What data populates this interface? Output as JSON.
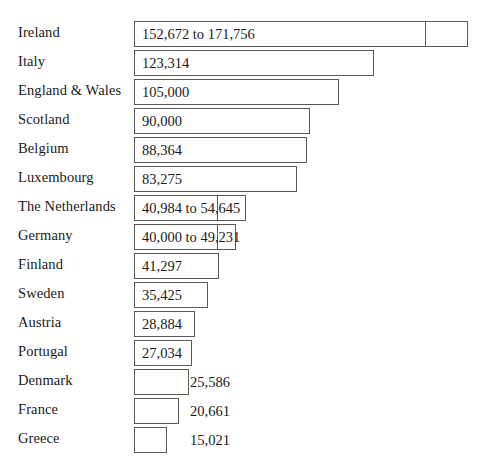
{
  "chart_data": {
    "type": "bar",
    "orientation": "horizontal",
    "title": "",
    "subtitle": "",
    "xlabel": "",
    "ylabel": "",
    "grid": false,
    "legend": "none",
    "axis_visible": false,
    "xlim": [
      0,
      180000
    ],
    "categories": [
      "Ireland",
      "Italy",
      "England & Wales",
      "Scotland",
      "Belgium",
      "Luxembourg",
      "The Netherlands",
      "Germany",
      "Finland",
      "Sweden",
      "Austria",
      "Portugal",
      "Denmark",
      "France",
      "Greece"
    ],
    "values": [
      171756,
      123314,
      105000,
      90000,
      88364,
      83275,
      54645,
      49231,
      41297,
      35425,
      28884,
      27034,
      25586,
      20661,
      15021
    ],
    "value_labels": [
      "152,672 to 171,756",
      "123,314",
      "105,000",
      "90,000",
      "88,364",
      "83,275",
      "40,984 to 54,645",
      "40,000 to 49,231",
      "41,297",
      "35,425",
      "28,884",
      "27,034",
      "25,586",
      "20,661",
      "15,021"
    ],
    "ranges": [
      {
        "category": "Ireland",
        "low": 152672,
        "high": 171756
      },
      {
        "category": "The Netherlands",
        "low": 40984,
        "high": 54645
      },
      {
        "category": "Germany",
        "low": 40000,
        "high": 49231
      }
    ],
    "label_placement": [
      "inside",
      "inside",
      "inside",
      "inside",
      "inside",
      "inside",
      "inside",
      "inside",
      "inside",
      "inside",
      "inside",
      "inside",
      "outside",
      "outside",
      "outside"
    ],
    "colors": {
      "bar_fill": "#ffffff",
      "bar_stroke": "#595959",
      "text": "#1a1a1a",
      "background": "#ffffff"
    }
  },
  "rows": [
    {
      "label": "Ireland",
      "value_label": "152,672 to 171,756",
      "placement": "inside",
      "bar_left": 134,
      "bar_width": 334,
      "split_at": 291,
      "top": 18,
      "value_x": 142
    },
    {
      "label": "Italy",
      "value_label": "123,314",
      "placement": "inside",
      "bar_left": 134,
      "bar_width": 240,
      "split_at": null,
      "top": 47,
      "value_x": 142
    },
    {
      "label": "England & Wales",
      "value_label": "105,000",
      "placement": "inside",
      "bar_left": 134,
      "bar_width": 205,
      "split_at": null,
      "top": 76,
      "value_x": 142
    },
    {
      "label": "Scotland",
      "value_label": "90,000",
      "placement": "inside",
      "bar_left": 134,
      "bar_width": 176,
      "split_at": null,
      "top": 105,
      "value_x": 142
    },
    {
      "label": "Belgium",
      "value_label": "88,364",
      "placement": "inside",
      "bar_left": 134,
      "bar_width": 173,
      "split_at": null,
      "top": 134,
      "value_x": 142
    },
    {
      "label": "Luxembourg",
      "value_label": "83,275",
      "placement": "inside",
      "bar_left": 134,
      "bar_width": 163,
      "split_at": null,
      "top": 163,
      "value_x": 142
    },
    {
      "label": "The Netherlands",
      "value_label": "40,984 to 54,645",
      "placement": "inside",
      "bar_left": 134,
      "bar_width": 112,
      "split_at": 83,
      "top": 192,
      "value_x": 142
    },
    {
      "label": "Germany",
      "value_label": "40,000 to 49,231",
      "placement": "inside",
      "bar_left": 134,
      "bar_width": 102,
      "split_at": 83,
      "top": 221,
      "value_x": 142
    },
    {
      "label": "Finland",
      "value_label": "41,297",
      "placement": "inside",
      "bar_left": 134,
      "bar_width": 85,
      "split_at": null,
      "top": 250,
      "value_x": 142
    },
    {
      "label": "Sweden",
      "value_label": "35,425",
      "placement": "inside",
      "bar_left": 134,
      "bar_width": 74,
      "split_at": null,
      "top": 279,
      "value_x": 142
    },
    {
      "label": "Austria",
      "value_label": "28,884",
      "placement": "inside",
      "bar_left": 134,
      "bar_width": 61,
      "split_at": null,
      "top": 308,
      "value_x": 142
    },
    {
      "label": "Portugal",
      "value_label": "27,034",
      "placement": "inside",
      "bar_left": 134,
      "bar_width": 58,
      "split_at": null,
      "top": 337,
      "value_x": 142
    },
    {
      "label": "Denmark",
      "value_label": "25,586",
      "placement": "outside",
      "bar_left": 134,
      "bar_width": 55,
      "split_at": null,
      "top": 366,
      "value_x": 190
    },
    {
      "label": "France",
      "value_label": "20,661",
      "placement": "outside",
      "bar_left": 134,
      "bar_width": 45,
      "split_at": null,
      "top": 395,
      "value_x": 190
    },
    {
      "label": "Greece",
      "value_label": "15,021",
      "placement": "outside",
      "bar_left": 134,
      "bar_width": 33,
      "split_at": null,
      "top": 424,
      "value_x": 190
    }
  ]
}
